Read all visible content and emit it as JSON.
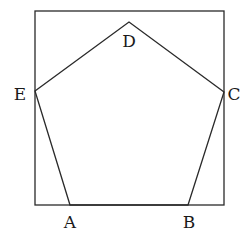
{
  "diagram": {
    "type": "geometry",
    "square": {
      "x1": 35,
      "y1": 11,
      "x2": 224,
      "y2": 205
    },
    "vertices": [
      {
        "name": "A",
        "label": "A",
        "x": 70,
        "y": 205,
        "lx": 70,
        "ly": 228
      },
      {
        "name": "B",
        "label": "B",
        "x": 188,
        "y": 205,
        "lx": 189,
        "ly": 228
      },
      {
        "name": "C",
        "label": "C",
        "x": 224,
        "y": 92,
        "lx": 234,
        "ly": 100
      },
      {
        "name": "D",
        "label": "D",
        "x": 129,
        "y": 22,
        "lx": 129,
        "ly": 47
      },
      {
        "name": "E",
        "label": "E",
        "x": 35,
        "y": 91,
        "lx": 20,
        "ly": 100
      }
    ],
    "stroke_color": "#2a2a2a",
    "background": "#ffffff"
  }
}
